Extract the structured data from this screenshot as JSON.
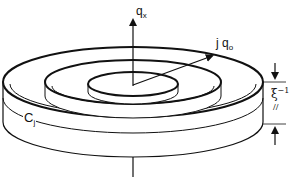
{
  "diagram": {
    "labels": {
      "axis_main": "q",
      "axis_main_sub": "x",
      "vector_prefix": "j q",
      "vector_sub": "o",
      "ring_label": "C",
      "ring_label_sub": "j",
      "thickness_symbol": "ξ",
      "thickness_sup": "−1",
      "thickness_sub": "//"
    },
    "colors": {
      "stroke": "#111111",
      "background": "#ffffff"
    }
  }
}
